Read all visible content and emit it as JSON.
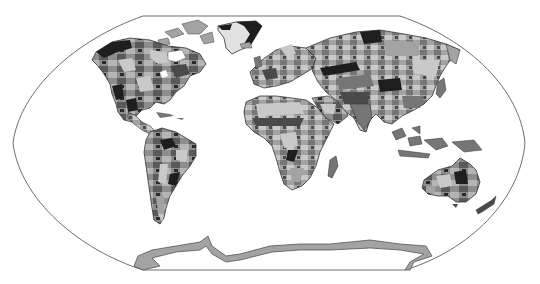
{
  "map": {
    "projection": "Robinson",
    "style": "grayscale world map of ecological / vegetation zones",
    "palette": {
      "ocean": "#ffffff",
      "outline": "#6e6e6e",
      "zone_darkest": "#1e1e1e",
      "zone_dark": "#4a4a4a",
      "zone_mid": "#767676",
      "zone_light": "#a3a3a3",
      "zone_lightest": "#c9c9c9",
      "ice": "#e2e2e2"
    },
    "regions": [
      {
        "name": "North America"
      },
      {
        "name": "Greenland"
      },
      {
        "name": "South America"
      },
      {
        "name": "Europe"
      },
      {
        "name": "Africa"
      },
      {
        "name": "Madagascar"
      },
      {
        "name": "Asia"
      },
      {
        "name": "Southeast Asia islands"
      },
      {
        "name": "Australia"
      },
      {
        "name": "New Zealand"
      },
      {
        "name": "Antarctica"
      }
    ]
  }
}
